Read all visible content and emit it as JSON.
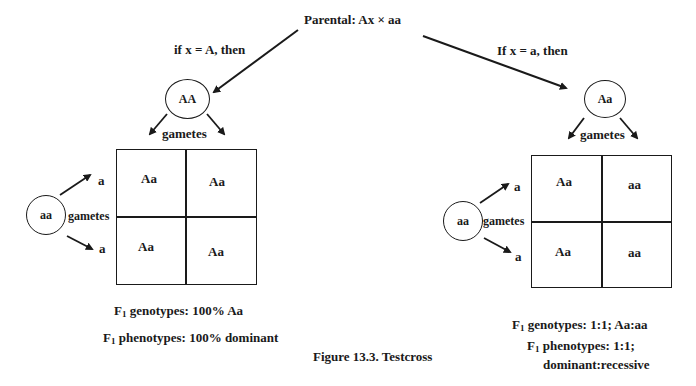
{
  "header": {
    "parental_label": "Parental: Ax × aa"
  },
  "left_case": {
    "condition": "if x = A, then",
    "parent_circle": "AA",
    "gametes_label_top": "gametes",
    "other_parent_circle": "aa",
    "gametes_label_side": "gametes",
    "side_gametes": [
      "a",
      "a"
    ],
    "punnett": [
      [
        "Aa",
        "Aa"
      ],
      [
        "Aa",
        "Aa"
      ]
    ],
    "genotypes_prefix": "F",
    "genotypes_sub": "1",
    "genotypes_text": " genotypes: 100% Aa",
    "phenotypes_prefix": "F",
    "phenotypes_sub": "1",
    "phenotypes_text": " phenotypes: 100% dominant"
  },
  "right_case": {
    "condition": "If x = a, then",
    "parent_circle": "Aa",
    "gametes_label_top": "gametes",
    "other_parent_circle": "aa",
    "gametes_label_side": "gametes",
    "side_gametes": [
      "a",
      "a"
    ],
    "punnett": [
      [
        "Aa",
        "aa"
      ],
      [
        "Aa",
        "aa"
      ]
    ],
    "genotypes_prefix": "F",
    "genotypes_sub": "1",
    "genotypes_text": " genotypes: 1:1; Aa:aa",
    "phenotypes_prefix": "F",
    "phenotypes_sub": "1",
    "phenotypes_text": " phenotypes: 1:1;",
    "phenotypes_text_line2": "dominant:recessive"
  },
  "caption": "Figure 13.3. Testcross",
  "colors": {
    "ink": "#1a1a1a",
    "background": "#ffffff"
  }
}
